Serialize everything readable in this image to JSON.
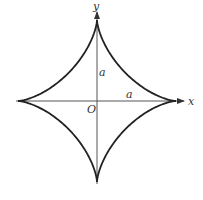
{
  "diagram": {
    "curve": "astroid x^(2/3) + y^(2/3) = a^(2/3)",
    "labels": {
      "x_axis": "x",
      "y_axis": "y",
      "origin": "O",
      "vertical_radius": "a",
      "horizontal_radius": "a"
    },
    "colors": {
      "curve": "#222222",
      "axis": "#444444",
      "background": "#ffffff"
    }
  }
}
